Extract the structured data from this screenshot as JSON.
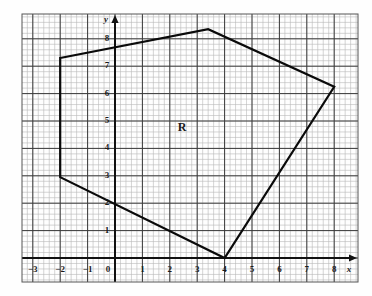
{
  "figure": {
    "title": "",
    "region_label": "R",
    "axis_labels": {
      "x": "x",
      "y": "y"
    },
    "background": "#fefefe",
    "grid_minor_color": "#b9b9b9",
    "grid_major_color": "#3a3a3a",
    "axis_color": "#111111",
    "shape_color": "#0a0a0a"
  },
  "chart_data": {
    "type": "scatter",
    "title": "",
    "xlabel": "x",
    "ylabel": "y",
    "xlim": [
      -3.8,
      9.0
    ],
    "ylim": [
      -0.85,
      8.75
    ],
    "grid": true,
    "minor_grid_per_unit": 5,
    "legend": null,
    "x_ticks": [
      -3,
      -2,
      -1,
      0,
      1,
      2,
      3,
      4,
      5,
      6,
      7,
      8
    ],
    "x_tick_labels": [
      "−3",
      "−2",
      "−1",
      "0",
      "1",
      "2",
      "3",
      "4",
      "5",
      "6",
      "7",
      "8"
    ],
    "y_ticks": [
      1,
      2,
      3,
      4,
      5,
      6,
      7,
      8
    ],
    "y_tick_labels": [
      "1",
      "2",
      "3",
      "4",
      "5",
      "6",
      "7",
      "8"
    ],
    "annotations": [
      {
        "text": "R",
        "x": 2.45,
        "y": 4.75
      }
    ],
    "series": [
      {
        "name": "Region R boundary",
        "type": "polygon",
        "closed": true,
        "color": "#0a0a0a",
        "linewidth": 2.2,
        "vertices": [
          {
            "x": -2.0,
            "y": 7.3
          },
          {
            "x": 3.4,
            "y": 8.35
          },
          {
            "x": 8.0,
            "y": 6.25
          },
          {
            "x": 4.0,
            "y": 0.0
          },
          {
            "x": -2.0,
            "y": 2.95
          }
        ]
      }
    ]
  },
  "ticks": {
    "x": [
      {
        "label": "−3",
        "x": -3
      },
      {
        "label": "−2",
        "x": -2
      },
      {
        "label": "−1",
        "x": -1
      },
      {
        "label": "0",
        "x": 0
      },
      {
        "label": "1",
        "x": 1
      },
      {
        "label": "2",
        "x": 2
      },
      {
        "label": "3",
        "x": 3
      },
      {
        "label": "4",
        "x": 4
      },
      {
        "label": "5",
        "x": 5
      },
      {
        "label": "6",
        "x": 6
      },
      {
        "label": "7",
        "x": 7
      },
      {
        "label": "8",
        "x": 8
      }
    ],
    "y": [
      {
        "label": "1",
        "y": 1
      },
      {
        "label": "2",
        "y": 2
      },
      {
        "label": "3",
        "y": 3
      },
      {
        "label": "4",
        "y": 4
      },
      {
        "label": "5",
        "y": 5
      },
      {
        "label": "6",
        "y": 6
      },
      {
        "label": "7",
        "y": 7
      },
      {
        "label": "8",
        "y": 8
      }
    ]
  }
}
